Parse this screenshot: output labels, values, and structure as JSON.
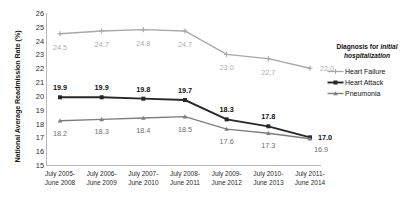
{
  "chart_data": {
    "type": "line",
    "title": "",
    "xlabel": "",
    "ylabel": "National Average Readmission Rate (%)",
    "ylim": [
      15,
      26
    ],
    "yticks": [
      26,
      25,
      24,
      23,
      22,
      21,
      20,
      19,
      18,
      17,
      16,
      15
    ],
    "grid": false,
    "legend_position": "right",
    "legend_title_line1": "Diagnosis for ",
    "legend_title_italic1": "initial",
    "legend_title_line2": "hospitalization",
    "categories": [
      "July 2005-June 2008",
      "July 2006-June 2009",
      "July 2007-June 2010",
      "July 2008-June 2011",
      "July 2009-June 2012",
      "July 2010-June 2013",
      "July 2011-June 2014"
    ],
    "categories_wrapped": [
      [
        "July 2005-",
        "June 2008"
      ],
      [
        "July 2006-",
        "June 2009"
      ],
      [
        "July 2007-",
        "June 2010"
      ],
      [
        "July 2008-",
        "June 2011"
      ],
      [
        "July 2009-",
        "June 2012"
      ],
      [
        "July 2010-",
        "June 2013"
      ],
      [
        "July 2011-",
        "June 2014"
      ]
    ],
    "series": [
      {
        "name": "Heart Failure",
        "key": "hf",
        "color": "#a8a8a8",
        "marker": "cross",
        "values": [
          24.5,
          24.7,
          24.8,
          24.7,
          23.0,
          22.7,
          22.0
        ],
        "labels": [
          "24.5",
          "24.7",
          "24.8",
          "24.7",
          "23.0",
          "22.7",
          "22.0"
        ]
      },
      {
        "name": "Heart Attack",
        "key": "ha",
        "color": "#262626",
        "marker": "square",
        "values": [
          19.9,
          19.9,
          19.8,
          19.7,
          18.3,
          17.8,
          17.0
        ],
        "labels": [
          "19.9",
          "19.9",
          "19.8",
          "19.7",
          "18.3",
          "17.8",
          "17.0"
        ]
      },
      {
        "name": "Pneumonia",
        "key": "pn",
        "color": "#7d7d7d",
        "marker": "triangle",
        "values": [
          18.2,
          18.3,
          18.4,
          18.5,
          17.6,
          17.3,
          16.9
        ],
        "labels": [
          "18.2",
          "18.3",
          "18.4",
          "18.5",
          "17.6",
          "17.3",
          "16.9"
        ]
      }
    ]
  }
}
